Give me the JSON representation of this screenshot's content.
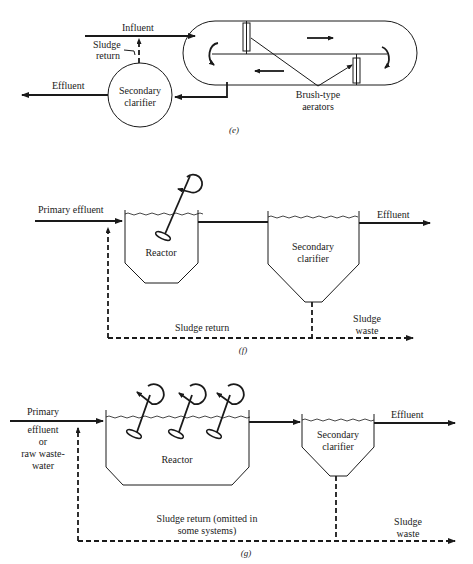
{
  "panels": {
    "e": {
      "caption": "(e)",
      "labels": {
        "influent": "Influent",
        "sludge_return_line1": "Sludge",
        "sludge_return_line2": "return",
        "effluent": "Effluent",
        "clarifier_line1": "Secondary",
        "clarifier_line2": "clarifier",
        "aerators_line1": "Brush-type",
        "aerators_line2": "aerators"
      }
    },
    "f": {
      "caption": "(f)",
      "labels": {
        "primary_effluent": "Primary effluent",
        "reactor": "Reactor",
        "clarifier_line1": "Secondary",
        "clarifier_line2": "clarifier",
        "effluent": "Effluent",
        "sludge_return": "Sludge return",
        "sludge_waste_line1": "Sludge",
        "sludge_waste_line2": "waste"
      }
    },
    "g": {
      "caption": "(g)",
      "labels": {
        "primary": "Primary",
        "effluent_line": "effluent",
        "or_line": "or",
        "raw_line": "raw waste-",
        "water_line": "water",
        "reactor": "Reactor",
        "clarifier_line1": "Secondary",
        "clarifier_line2": "clarifier",
        "effluent": "Effluent",
        "sludge_return_line1": "Sludge return (omitted in",
        "sludge_return_line2": "some systems)",
        "sludge_waste_line1": "Sludge",
        "sludge_waste_line2": "waste"
      }
    }
  }
}
